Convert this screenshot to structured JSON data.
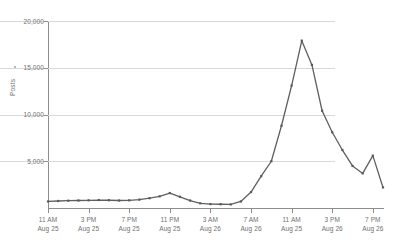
{
  "chart_data": {
    "type": "line",
    "title": "",
    "xlabel": "",
    "ylabel": "Posts",
    "ylim": [
      0,
      20000
    ],
    "grid": true,
    "legend": "none",
    "series_color": "#5a5a5a",
    "marker": "square",
    "y_ticks": [
      {
        "value": 20000,
        "label": "20,000"
      },
      {
        "value": 15000,
        "label": "15,000"
      },
      {
        "value": 10000,
        "label": "10,000"
      },
      {
        "value": 5000,
        "label": "5,000"
      }
    ],
    "x_ticks": [
      {
        "index": 0,
        "time": "11 AM",
        "date": "Aug 25"
      },
      {
        "index": 4,
        "time": "3 PM",
        "date": "Aug 25"
      },
      {
        "index": 8,
        "time": "7 PM",
        "date": "Aug 25"
      },
      {
        "index": 12,
        "time": "11 PM",
        "date": "Aug 25"
      },
      {
        "index": 16,
        "time": "3 AM",
        "date": "Aug 26"
      },
      {
        "index": 20,
        "time": "7 AM",
        "date": "Aug 26"
      },
      {
        "index": 24,
        "time": "11 AM",
        "date": "Aug 25"
      },
      {
        "index": 28,
        "time": "3 PM",
        "date": "Aug 26"
      },
      {
        "index": 32,
        "time": "7 PM",
        "date": "Aug 26"
      }
    ],
    "x": [
      "11 AM Aug 25",
      "12 PM Aug 25",
      "1 PM Aug 25",
      "2 PM Aug 25",
      "3 PM Aug 25",
      "4 PM Aug 25",
      "5 PM Aug 25",
      "6 PM Aug 25",
      "7 PM Aug 25",
      "8 PM Aug 25",
      "9 PM Aug 25",
      "10 PM Aug 25",
      "11 PM Aug 25",
      "12 AM Aug 26",
      "1 AM Aug 26",
      "2 AM Aug 26",
      "3 AM Aug 26",
      "4 AM Aug 26",
      "5 AM Aug 26",
      "6 AM Aug 26",
      "7 AM Aug 26",
      "8 AM Aug 26",
      "9 AM Aug 26",
      "10 AM Aug 26",
      "11 AM Aug 26",
      "12 PM Aug 26",
      "1 PM Aug 26",
      "2 PM Aug 26",
      "3 PM Aug 26",
      "4 PM Aug 26",
      "5 PM Aug 26",
      "6 PM Aug 26",
      "7 PM Aug 26",
      "8 PM Aug 26"
    ],
    "values": [
      700,
      750,
      780,
      800,
      820,
      850,
      830,
      800,
      820,
      900,
      1050,
      1250,
      1600,
      1200,
      800,
      500,
      420,
      400,
      380,
      700,
      1700,
      3400,
      5000,
      8800,
      13100,
      17900,
      15300,
      10400,
      8100,
      6200,
      4500,
      3700,
      5600,
      2200
    ],
    "peak": {
      "value": 17900,
      "at": "12 PM Aug 26"
    }
  }
}
